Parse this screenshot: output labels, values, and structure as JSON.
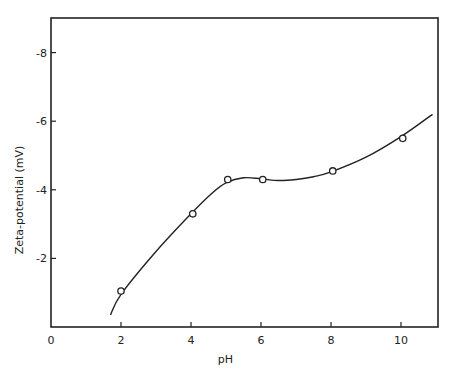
{
  "chart_data": {
    "type": "line",
    "title": "",
    "xlabel": "pH",
    "ylabel": "Zeta-potential (mV)",
    "xlim": [
      0,
      10.9
    ],
    "ylim": [
      0,
      -9
    ],
    "x_ticks": [
      0,
      2,
      4,
      6,
      8,
      10
    ],
    "y_ticks": [
      -2,
      -4,
      -6,
      -8
    ],
    "x_tick_labels": [
      "0",
      "2",
      "4",
      "6",
      "8",
      "10"
    ],
    "y_tick_labels": [
      "-2",
      "-4",
      "-6",
      "-8"
    ],
    "grid": false,
    "legend": null,
    "series": [
      {
        "name": "measured",
        "marker": "open-circle",
        "x": [
          2.0,
          4.05,
          5.05,
          6.05,
          8.05,
          10.05
        ],
        "y": [
          -1.05,
          -3.3,
          -4.3,
          -4.3,
          -4.55,
          -5.5
        ]
      },
      {
        "name": "fitted curve",
        "marker": "none",
        "x": [
          1.7,
          2.0,
          3.0,
          4.0,
          4.6,
          5.0,
          5.5,
          6.0,
          6.5,
          7.0,
          7.5,
          8.0,
          9.0,
          10.0,
          10.9
        ],
        "y": [
          -0.35,
          -0.95,
          -2.2,
          -3.3,
          -3.9,
          -4.2,
          -4.35,
          -4.32,
          -4.27,
          -4.3,
          -4.38,
          -4.52,
          -4.95,
          -5.55,
          -6.2
        ]
      }
    ]
  },
  "plot": {
    "left": 51,
    "right": 438,
    "top": 18,
    "bottom": 327,
    "px_per_x": 35,
    "px_per_y": 34.3
  }
}
